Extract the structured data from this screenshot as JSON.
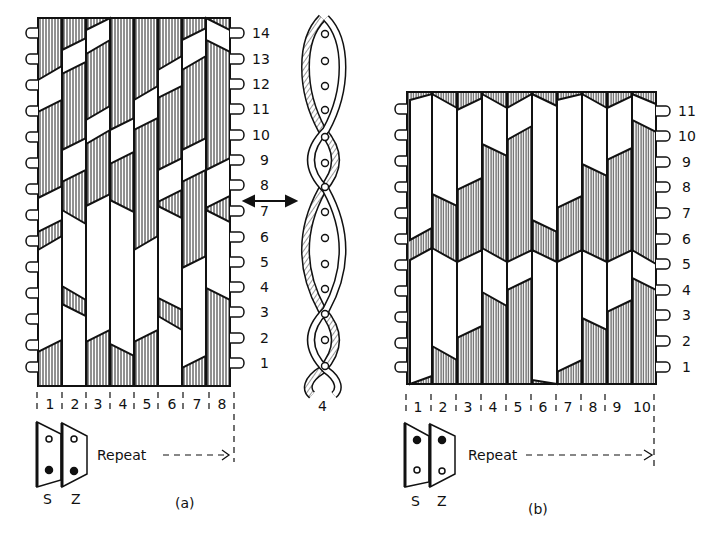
{
  "figure_a": {
    "caption": "(a)",
    "rows": [
      "1",
      "2",
      "3",
      "4",
      "5",
      "6",
      "7",
      "8",
      "9",
      "10",
      "11",
      "12",
      "13",
      "14"
    ],
    "columns": [
      "1",
      "2",
      "3",
      "4",
      "5",
      "6",
      "7",
      "8"
    ],
    "repeat_label": "Repeat",
    "tablets": [
      {
        "label": "S",
        "top_hole": "open",
        "bottom_hole": "filled"
      },
      {
        "label": "Z",
        "top_hole": "open",
        "bottom_hole": "filled"
      }
    ]
  },
  "twist_detail": {
    "label": "4",
    "arrow": "double-arrow-horizontal"
  },
  "figure_b": {
    "caption": "(b)",
    "rows": [
      "1",
      "2",
      "3",
      "4",
      "5",
      "6",
      "7",
      "8",
      "9",
      "10",
      "11"
    ],
    "columns": [
      "1",
      "2",
      "3",
      "4",
      "5",
      "6",
      "7",
      "8",
      "9",
      "10"
    ],
    "repeat_label": "Repeat",
    "tablets": [
      {
        "label": "S",
        "top_hole": "filled",
        "bottom_hole": "open"
      },
      {
        "label": "Z",
        "top_hole": "filled",
        "bottom_hole": "open"
      }
    ]
  }
}
